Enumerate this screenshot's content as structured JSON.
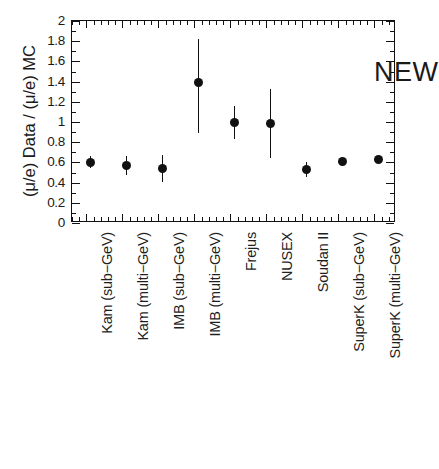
{
  "figure": {
    "annotation": "NEW",
    "y_axis_title": "(μ/e) Data / (μ/e) MC",
    "corner_artifact": ""
  },
  "axis": {
    "y_tick_labels": [
      "2",
      "1.8",
      "1.6",
      "1.4",
      "1.2",
      "1",
      "0.8",
      "0.6",
      "0.4",
      "0.2",
      "0"
    ],
    "y_min": 0,
    "y_max": 2,
    "y_tick_step": 0.2
  },
  "chart_data": {
    "type": "scatter",
    "title": "",
    "subtitle": "",
    "xlabel": "",
    "ylabel": "(μ/e) Data / (μ/e) MC",
    "ylim": [
      0,
      2
    ],
    "ytick_step": 0.2,
    "grid": false,
    "legend": false,
    "annotations": [
      {
        "text": "NEW",
        "x": 7.3,
        "y": 1.78
      }
    ],
    "categories": [
      "Kam (sub−GeV)",
      "Kam (multi−GeV)",
      "IMB (sub−GeV)",
      "IMB (multi−GeV)",
      "Frejus",
      "NUSEX",
      "Soudan II",
      "SuperK (sub−GeV)",
      "SuperK (multi−GeV)"
    ],
    "values": [
      0.6,
      0.57,
      0.54,
      1.39,
      1.0,
      0.99,
      0.53,
      0.61,
      0.63
    ],
    "err_low": [
      0.06,
      0.09,
      0.13,
      0.5,
      0.17,
      0.35,
      0.07,
      0.03,
      0.03
    ],
    "err_high": [
      0.06,
      0.09,
      0.13,
      0.43,
      0.16,
      0.34,
      0.07,
      0.03,
      0.03
    ],
    "points": [
      {
        "category": "Kam (sub−GeV)",
        "value": 0.6,
        "err_low": 0.06,
        "err_high": 0.06
      },
      {
        "category": "Kam (multi−GeV)",
        "value": 0.57,
        "err_low": 0.09,
        "err_high": 0.09
      },
      {
        "category": "IMB (sub−GeV)",
        "value": 0.54,
        "err_low": 0.13,
        "err_high": 0.13
      },
      {
        "category": "IMB (multi−GeV)",
        "value": 1.39,
        "err_low": 0.5,
        "err_high": 0.43
      },
      {
        "category": "Frejus",
        "value": 1.0,
        "err_low": 0.17,
        "err_high": 0.16
      },
      {
        "category": "NUSEX",
        "value": 0.99,
        "err_low": 0.35,
        "err_high": 0.34
      },
      {
        "category": "Soudan II",
        "value": 0.53,
        "err_low": 0.07,
        "err_high": 0.07
      },
      {
        "category": "SuperK (sub−GeV)",
        "value": 0.61,
        "err_low": 0.03,
        "err_high": 0.03
      },
      {
        "category": "SuperK (multi−GeV)",
        "value": 0.63,
        "err_low": 0.03,
        "err_high": 0.03
      }
    ]
  }
}
